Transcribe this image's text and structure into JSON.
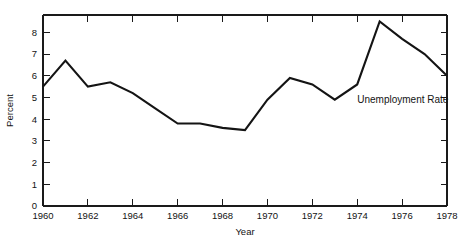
{
  "chart_data": {
    "type": "line",
    "title": "",
    "subtitle": "",
    "xlabel": "Year",
    "ylabel": "Percent",
    "xlim": [
      1960,
      1978
    ],
    "ylim": [
      0,
      8.8
    ],
    "grid": false,
    "legend_position": "inline-annotation",
    "annotations": [
      {
        "text": "Unemployment Rate",
        "x": 1974.0,
        "y": 4.75
      }
    ],
    "x_tick_labels": [
      "1960",
      "1962",
      "1964",
      "1966",
      "1968",
      "1970",
      "1972",
      "1974",
      "1976",
      "1978"
    ],
    "x_tick_values": [
      1960,
      1962,
      1964,
      1966,
      1968,
      1970,
      1972,
      1974,
      1976,
      1978
    ],
    "x_minor_tick_values": [
      1961,
      1963,
      1965,
      1967,
      1969,
      1971,
      1973,
      1975,
      1977
    ],
    "y_tick_labels": [
      "0",
      "1",
      "2",
      "3",
      "4",
      "5",
      "6",
      "7",
      "8"
    ],
    "y_tick_values": [
      0,
      1,
      2,
      3,
      4,
      5,
      6,
      7,
      8
    ],
    "x": [
      1960,
      1961,
      1962,
      1963,
      1964,
      1965,
      1966,
      1967,
      1968,
      1969,
      1970,
      1971,
      1972,
      1973,
      1974,
      1975,
      1976,
      1977,
      1978
    ],
    "series": [
      {
        "name": "Unemployment Rate",
        "color": "#141414",
        "values": [
          5.5,
          6.7,
          5.5,
          5.7,
          5.2,
          4.5,
          3.8,
          3.8,
          3.6,
          3.5,
          4.9,
          5.9,
          5.6,
          4.9,
          5.6,
          8.5,
          7.7,
          7.0,
          6.0
        ]
      }
    ]
  },
  "axis_titles": {
    "x": "Year",
    "y": "Percent"
  },
  "annotation_label": "Unemployment Rate"
}
